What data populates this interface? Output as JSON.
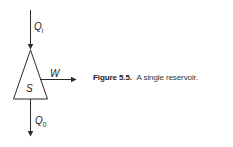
{
  "figure": {
    "caption_label": "Figure 5.5.",
    "caption_text": "A single reservoir."
  },
  "diagram": {
    "inflow": {
      "symbol": "Q",
      "subscript": "i"
    },
    "storage": {
      "symbol": "S"
    },
    "withdrawal": {
      "symbol": "W"
    },
    "outflow": {
      "symbol": "Q",
      "subscript": "0"
    }
  },
  "colors": {
    "line": "#2a2a2a",
    "text": "#222222"
  }
}
